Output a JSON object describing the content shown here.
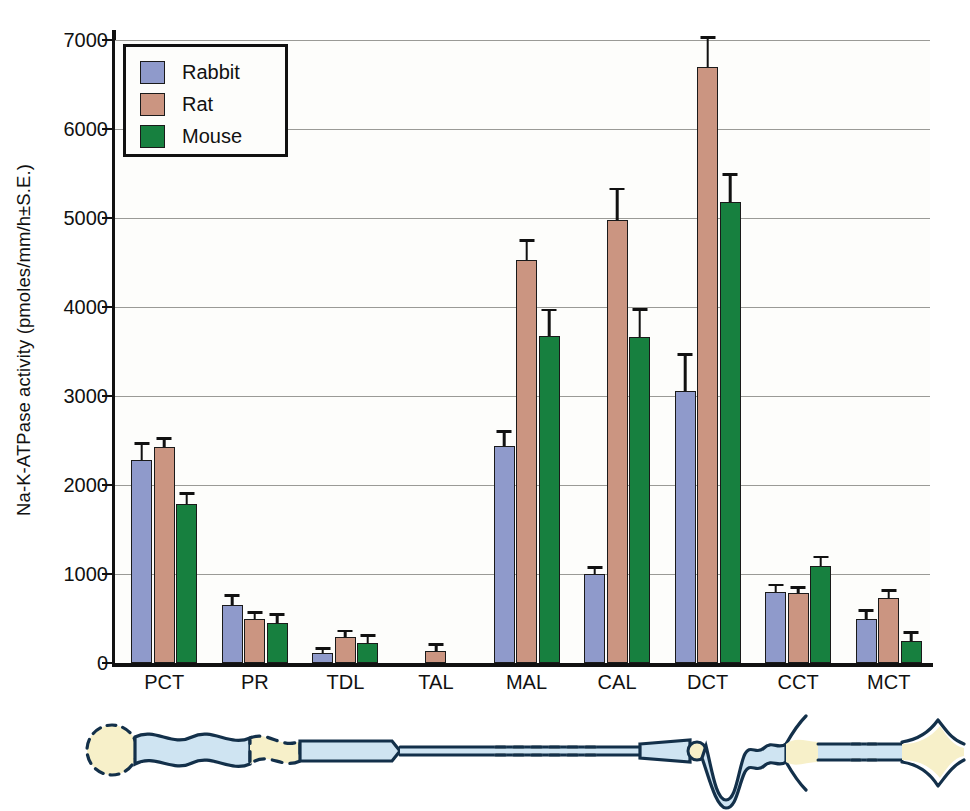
{
  "chart_data": {
    "type": "bar",
    "title": "",
    "xlabel": "",
    "ylabel": "Na-K-ATPase activity (pmoles/mm/h±S.E.)",
    "ylim": [
      0,
      7000
    ],
    "yticks": [
      0,
      1000,
      2000,
      3000,
      4000,
      5000,
      6000,
      7000
    ],
    "ytick_labels": [
      "0",
      "1000",
      "2000",
      "3000",
      "4000",
      "5000",
      "6000",
      "7000"
    ],
    "grid": true,
    "legend_position": "top-left",
    "categories": [
      "PCT",
      "PR",
      "TDL",
      "TAL",
      "MAL",
      "CAL",
      "DCT",
      "CCT",
      "MCT"
    ],
    "series": [
      {
        "name": "Rabbit",
        "color": "#8f9acb",
        "values": [
          2280,
          650,
          110,
          null,
          2440,
          1000,
          3060,
          800,
          490
        ],
        "errors": [
          170,
          90,
          40,
          null,
          150,
          60,
          390,
          60,
          85
        ]
      },
      {
        "name": "Rat",
        "color": "#cb9581",
        "values": [
          2430,
          490,
          290,
          140,
          4530,
          4980,
          6700,
          790,
          730
        ],
        "errors": [
          80,
          60,
          55,
          50,
          200,
          330,
          310,
          45,
          70
        ]
      },
      {
        "name": "Mouse",
        "color": "#17803f",
        "values": [
          1790,
          450,
          230,
          null,
          3670,
          3660,
          5180,
          1090,
          250
        ],
        "errors": [
          100,
          80,
          60,
          null,
          280,
          300,
          290,
          85,
          80
        ]
      }
    ]
  },
  "legend": {
    "entries": [
      {
        "label": "Rabbit",
        "color": "#8f9acb"
      },
      {
        "label": "Rat",
        "color": "#cb9581"
      },
      {
        "label": "Mouse",
        "color": "#17803f"
      }
    ]
  },
  "diagram": {
    "name": "nephron-schematic",
    "colors": {
      "lumen": "#cfe4f2",
      "cream": "#f7f0c9",
      "outline": "#13304a"
    }
  }
}
